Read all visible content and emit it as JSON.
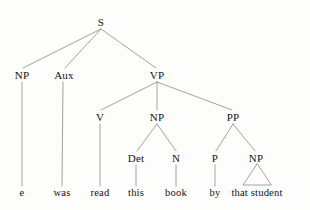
{
  "figure": {
    "kind": "constituency-syntax-tree",
    "sentence": "e was read this book by that student",
    "width": 310,
    "height": 210,
    "background_color": "#fdfdfc",
    "line_color": "#8a8a8a",
    "text_color": "#121212"
  },
  "nodes": {
    "s": {
      "label": "S",
      "x": 101,
      "y": 22
    },
    "np_subject": {
      "label": "NP",
      "x": 22,
      "y": 75
    },
    "aux": {
      "label": "Aux",
      "x": 64,
      "y": 75
    },
    "vp": {
      "label": "VP",
      "x": 157,
      "y": 75
    },
    "v": {
      "label": "V",
      "x": 100,
      "y": 117
    },
    "np_object": {
      "label": "NP",
      "x": 157,
      "y": 117
    },
    "pp": {
      "label": "PP",
      "x": 233,
      "y": 117
    },
    "det": {
      "label": "Det",
      "x": 136,
      "y": 158
    },
    "n": {
      "label": "N",
      "x": 176,
      "y": 158
    },
    "p": {
      "label": "P",
      "x": 215,
      "y": 158
    },
    "np_oblique": {
      "label": "NP",
      "x": 256,
      "y": 158
    }
  },
  "leaves": {
    "trace": {
      "label": "e",
      "x": 22,
      "y": 193
    },
    "was": {
      "label": "was",
      "x": 62,
      "y": 193
    },
    "read": {
      "label": "read",
      "x": 100,
      "y": 193
    },
    "this": {
      "label": "this",
      "x": 136,
      "y": 193
    },
    "book": {
      "label": "book",
      "x": 176,
      "y": 193
    },
    "by": {
      "label": "by",
      "x": 215,
      "y": 193
    },
    "that_student": {
      "label": "that student",
      "x": 257,
      "y": 193
    }
  },
  "triangle": {
    "apex_x": 257,
    "apex_y": 164,
    "left_x": 243,
    "base_y": 185,
    "right_x": 271
  }
}
